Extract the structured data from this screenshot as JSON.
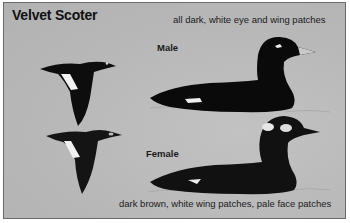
{
  "plate": {
    "title": "Velvet Scoter",
    "background_color": "#b9b9b9",
    "border_color": "#6a6a6a"
  },
  "male": {
    "label": "Male",
    "description": "all dark, white eye and wing patches"
  },
  "female": {
    "label": "Female",
    "description": "dark brown, white wing patches, pale face patches"
  },
  "illustrations": [
    {
      "name": "male-flying",
      "color": "#0d0d0d"
    },
    {
      "name": "female-flying",
      "color": "#141414"
    },
    {
      "name": "male-swimming",
      "color": "#0a0a0a"
    },
    {
      "name": "female-swimming",
      "color": "#111111"
    }
  ]
}
